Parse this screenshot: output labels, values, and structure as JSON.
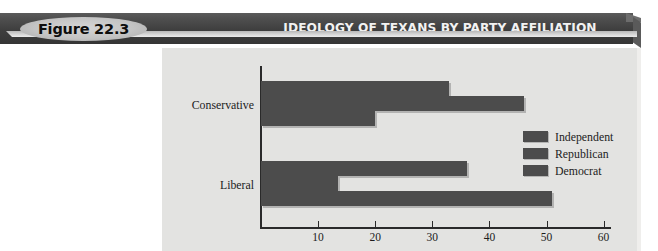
{
  "banner": {
    "figure_label": "Figure 22.3",
    "title": "IDEOLOGY OF TEXANS BY PARTY AFFILIATION",
    "bar_color": "#3e3e3e",
    "pill_color": "#c4c4c4",
    "title_color": "#f2f2f2"
  },
  "chart_data": {
    "type": "bar",
    "orientation": "horizontal",
    "title": "IDEOLOGY OF TEXANS BY PARTY AFFILIATION",
    "xlabel": "",
    "ylabel": "",
    "categories": [
      "Conservative",
      "Liberal"
    ],
    "series": [
      {
        "name": "Independent",
        "values": [
          33,
          36
        ]
      },
      {
        "name": "Republican",
        "values": [
          46,
          13.5
        ]
      },
      {
        "name": "Democrat",
        "values": [
          20,
          51
        ]
      }
    ],
    "xlim": [
      0,
      63
    ],
    "xticks": [
      10,
      20,
      30,
      40,
      50,
      60
    ],
    "xtick_labels": [
      "10",
      "20",
      "30",
      "40",
      "50",
      "60"
    ],
    "grid": false,
    "legend_position": "right-middle",
    "bar_color": "#4c4c4c",
    "plot_background": "#e3e3e1"
  }
}
